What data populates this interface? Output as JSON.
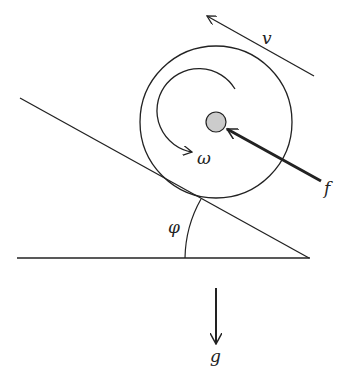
{
  "diagram": {
    "labels": {
      "velocity": "v",
      "angular_velocity": "ω",
      "force": "f",
      "incline_angle": "φ",
      "gravity": "g"
    },
    "colors": {
      "stroke": "#222222",
      "hub_fill": "#cccccc",
      "background": "#ffffff"
    }
  }
}
